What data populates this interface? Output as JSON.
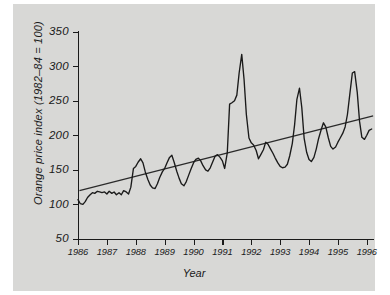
{
  "chart_data": {
    "type": "line",
    "title": "",
    "xlabel": "Year",
    "ylabel": "Orange price index (1982–84 = 100)",
    "xlim": [
      1986.0,
      1996.25
    ],
    "ylim": [
      50,
      350
    ],
    "yticks": [
      50,
      100,
      150,
      200,
      250,
      300,
      350
    ],
    "xticks": [
      1986,
      1987,
      1988,
      1989,
      1990,
      1991,
      1992,
      1993,
      1994,
      1995,
      1996
    ],
    "xtick_labels": [
      "1986",
      "1987",
      "1988",
      "1989",
      "1990",
      "1991",
      "1992",
      "1993",
      "1994",
      "1995",
      "1996"
    ],
    "grid": false,
    "legend": null,
    "series": [
      {
        "name": "Orange price index",
        "type": "line",
        "color": "#1a1a1a",
        "x": [
          1986.0,
          1986.08,
          1986.17,
          1986.25,
          1986.33,
          1986.42,
          1986.5,
          1986.58,
          1986.67,
          1986.75,
          1986.83,
          1986.92,
          1987.0,
          1987.08,
          1987.17,
          1987.25,
          1987.33,
          1987.42,
          1987.5,
          1987.58,
          1987.67,
          1987.75,
          1987.83,
          1987.92,
          1988.0,
          1988.08,
          1988.17,
          1988.25,
          1988.33,
          1988.42,
          1988.5,
          1988.58,
          1988.67,
          1988.75,
          1988.83,
          1988.92,
          1989.0,
          1989.08,
          1989.17,
          1989.25,
          1989.33,
          1989.42,
          1989.5,
          1989.58,
          1989.67,
          1989.75,
          1989.83,
          1989.92,
          1990.0,
          1990.08,
          1990.17,
          1990.25,
          1990.33,
          1990.42,
          1990.5,
          1990.58,
          1990.67,
          1990.75,
          1990.83,
          1990.92,
          1991.0,
          1991.08,
          1991.17,
          1991.25,
          1991.33,
          1991.42,
          1991.5,
          1991.58,
          1991.67,
          1991.75,
          1991.83,
          1991.92,
          1992.0,
          1992.08,
          1992.17,
          1992.25,
          1992.33,
          1992.42,
          1992.5,
          1992.58,
          1992.67,
          1992.75,
          1992.83,
          1992.92,
          1993.0,
          1993.08,
          1993.17,
          1993.25,
          1993.33,
          1993.42,
          1993.5,
          1993.58,
          1993.67,
          1993.75,
          1993.83,
          1993.92,
          1994.0,
          1994.08,
          1994.17,
          1994.25,
          1994.33,
          1994.42,
          1994.5,
          1994.58,
          1994.67,
          1994.75,
          1994.83,
          1994.92,
          1995.0,
          1995.08,
          1995.17,
          1995.25,
          1995.33,
          1995.42,
          1995.5,
          1995.58,
          1995.67,
          1995.75,
          1995.83,
          1995.92,
          1996.0,
          1996.08,
          1996.17
        ],
        "values": [
          107,
          101,
          100,
          104,
          110,
          114,
          117,
          116,
          119,
          118,
          117,
          118,
          115,
          119,
          116,
          118,
          114,
          117,
          114,
          120,
          118,
          115,
          125,
          152,
          155,
          161,
          166,
          160,
          147,
          136,
          128,
          124,
          123,
          130,
          139,
          147,
          152,
          160,
          168,
          171,
          161,
          148,
          138,
          130,
          127,
          133,
          142,
          152,
          160,
          165,
          167,
          163,
          156,
          150,
          148,
          153,
          162,
          170,
          172,
          168,
          163,
          152,
          175,
          245,
          247,
          250,
          258,
          290,
          317,
          281,
          230,
          196,
          189,
          186,
          178,
          166,
          172,
          179,
          190,
          187,
          180,
          174,
          167,
          160,
          155,
          153,
          154,
          158,
          170,
          188,
          215,
          252,
          268,
          240,
          196,
          175,
          165,
          162,
          168,
          180,
          195,
          208,
          218,
          212,
          196,
          184,
          180,
          183,
          190,
          196,
          203,
          212,
          230,
          262,
          290,
          292,
          262,
          220,
          197,
          194,
          200,
          207,
          209
        ]
      },
      {
        "name": "Linear trend",
        "type": "line",
        "color": "#2a2a2a",
        "x": [
          1986.05,
          1996.22
        ],
        "values": [
          120,
          228
        ]
      }
    ]
  },
  "axes": {
    "ylabel_text": "Orange price index (1982–84 = 100)",
    "xlabel_text": "Year",
    "ytick_labels": [
      "350",
      "300",
      "250",
      "200",
      "150",
      "100",
      "50"
    ],
    "xtick_labels": [
      "1986",
      "1987",
      "1988",
      "1989",
      "1990",
      "1991",
      "1992",
      "1993",
      "1994",
      "1995",
      "1996"
    ]
  },
  "colors": {
    "figure_background": "#d8d8d6",
    "axis": "#1a1a1a",
    "series_line": "#1a1a1a",
    "trend_line": "#2a2a2a",
    "text": "#1a1a1a"
  }
}
